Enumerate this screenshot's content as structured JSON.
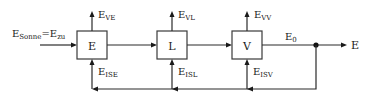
{
  "diagram": {
    "type": "block-flow-diagram",
    "input_label": {
      "main": "E",
      "sub": "Sonne",
      "eq": "=E",
      "sub2": "zu"
    },
    "output_label": "E",
    "intermediate_label": {
      "main": "E",
      "sub": "0"
    },
    "blocks": [
      {
        "id": "E",
        "label": "E",
        "loss_label": {
          "main": "E",
          "sub": "VE"
        },
        "feedback_label": {
          "main": "E",
          "sub": "ISE"
        }
      },
      {
        "id": "L",
        "label": "L",
        "loss_label": {
          "main": "E",
          "sub": "VL"
        },
        "feedback_label": {
          "main": "E",
          "sub": "ISL"
        }
      },
      {
        "id": "V",
        "label": "V",
        "loss_label": {
          "main": "E",
          "sub": "VV"
        },
        "feedback_label": {
          "main": "E",
          "sub": "ISV"
        }
      }
    ],
    "edges": [
      {
        "from": "input",
        "to": "E"
      },
      {
        "from": "E",
        "to": "L"
      },
      {
        "from": "L",
        "to": "V"
      },
      {
        "from": "V",
        "to": "junction",
        "label": "E0"
      },
      {
        "from": "junction",
        "to": "output"
      },
      {
        "from": "junction",
        "to": "feedback-bus"
      },
      {
        "from": "feedback-bus",
        "to": "V",
        "label": "EISV"
      },
      {
        "from": "feedback-bus",
        "to": "L",
        "label": "EISL"
      },
      {
        "from": "feedback-bus",
        "to": "E",
        "label": "EISE"
      },
      {
        "from": "E",
        "to": "loss",
        "label": "EVE"
      },
      {
        "from": "L",
        "to": "loss",
        "label": "EVL"
      },
      {
        "from": "V",
        "to": "loss",
        "label": "EVV"
      }
    ]
  }
}
